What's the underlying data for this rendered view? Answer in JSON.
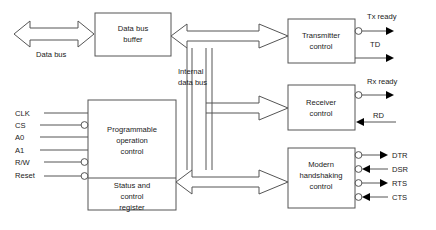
{
  "diagram": {
    "stroke_color": "#555555",
    "text_color": "#1a1a1a",
    "background": "#ffffff",
    "blocks": [
      {
        "id": "data-bus-buffer",
        "lines": [
          "Data bus",
          "buffer"
        ]
      },
      {
        "id": "programmable-operation-control",
        "lines": [
          "Programmable",
          "operation",
          "control"
        ]
      },
      {
        "id": "status-and-control-register",
        "lines": [
          "Status and",
          "control",
          "register"
        ]
      },
      {
        "id": "transmitter-control",
        "lines": [
          "Transmitter",
          "control"
        ]
      },
      {
        "id": "receiver-control",
        "lines": [
          "Receiver",
          "control"
        ]
      },
      {
        "id": "modem-handshaking-control",
        "lines": [
          "Modern",
          "handshaking",
          "control"
        ]
      }
    ],
    "bus_labels": {
      "external": "Data bus",
      "internal_line1": "Internal",
      "internal_line2": "data bus"
    },
    "left_pins": [
      {
        "name": "CLK",
        "label": "CLK",
        "active_low": false
      },
      {
        "name": "CS",
        "label": "CS",
        "active_low": true
      },
      {
        "name": "A0",
        "label": "A0",
        "active_low": false
      },
      {
        "name": "A1",
        "label": "A1",
        "active_low": false
      },
      {
        "name": "R/W",
        "label": "R/W",
        "active_low": true
      },
      {
        "name": "Reset",
        "label": "Reset",
        "active_low": true
      }
    ],
    "right_pins": [
      {
        "name": "tx-ready",
        "label": "Tx ready",
        "direction": "out",
        "active_low": true,
        "group": "transmitter"
      },
      {
        "name": "td",
        "label": "TD",
        "direction": "out",
        "active_low": false,
        "group": "transmitter"
      },
      {
        "name": "rx-ready",
        "label": "Rx ready",
        "direction": "out",
        "active_low": true,
        "group": "receiver"
      },
      {
        "name": "rd",
        "label": "RD",
        "direction": "in",
        "active_low": false,
        "group": "receiver"
      },
      {
        "name": "dtr",
        "label": "DTR",
        "direction": "out",
        "active_low": true,
        "group": "modem"
      },
      {
        "name": "dsr",
        "label": "DSR",
        "direction": "in",
        "active_low": true,
        "group": "modem"
      },
      {
        "name": "rts",
        "label": "RTS",
        "direction": "out",
        "active_low": true,
        "group": "modem"
      },
      {
        "name": "cts",
        "label": "CTS",
        "direction": "in",
        "active_low": true,
        "group": "modem"
      }
    ]
  }
}
